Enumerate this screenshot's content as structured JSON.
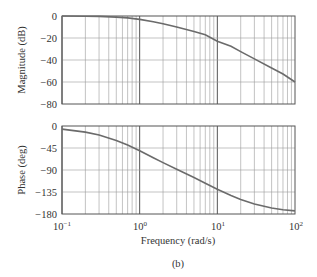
{
  "chart_data": [
    {
      "type": "line",
      "title": "",
      "xlabel": "",
      "ylabel": "Magnitude (dB)",
      "xscale": "log",
      "xlim": [
        0.1,
        100
      ],
      "ylim": [
        -80,
        0
      ],
      "yticks": [
        "0",
        "−20",
        "−40",
        "−60",
        "−80"
      ],
      "ytick_values": [
        0,
        -20,
        -40,
        -60,
        -80
      ],
      "grid": true,
      "series": [
        {
          "name": "magnitude",
          "x": [
            0.1,
            0.2,
            0.3,
            0.5,
            0.7,
            1,
            1.5,
            2,
            3,
            5,
            7,
            10,
            15,
            20,
            30,
            50,
            70,
            100
          ],
          "values": [
            -0.04,
            -0.17,
            -0.39,
            -1.0,
            -1.7,
            -3.1,
            -5.2,
            -7.0,
            -10.0,
            -14.2,
            -17.1,
            -23.0,
            -27.5,
            -32.4,
            -39.0,
            -47.3,
            -52.7,
            -60.0
          ]
        }
      ]
    },
    {
      "type": "line",
      "title": "",
      "xlabel": "Frequency (rad/s)",
      "ylabel": "Phase (deg)",
      "xscale": "log",
      "xlim": [
        0.1,
        100
      ],
      "ylim": [
        -180,
        0
      ],
      "xticks": [
        "10−1",
        "100",
        "101",
        "102"
      ],
      "xtick_values": [
        0.1,
        1,
        10,
        100
      ],
      "yticks": [
        "0",
        "−45",
        "−90",
        "−135",
        "−180"
      ],
      "ytick_values": [
        0,
        -45,
        -90,
        -135,
        -180
      ],
      "grid": true,
      "series": [
        {
          "name": "phase",
          "x": [
            0.1,
            0.2,
            0.3,
            0.5,
            0.7,
            1,
            1.5,
            2,
            3,
            5,
            7,
            10,
            15,
            20,
            30,
            50,
            70,
            100
          ],
          "values": [
            -6.3,
            -12.4,
            -18.4,
            -29.4,
            -39.0,
            -50.7,
            -65.0,
            -74.8,
            -88.3,
            -105.3,
            -116.9,
            -129.3,
            -142.0,
            -150.3,
            -159.6,
            -167.7,
            -171.2,
            -173.7
          ]
        }
      ]
    }
  ],
  "magnitude_plot": {
    "ylabel": "Magnitude (dB)",
    "yticks": [
      "0",
      "−20",
      "−40",
      "−60",
      "−80"
    ]
  },
  "phase_plot": {
    "ylabel": "Phase (deg)",
    "yticks": [
      "0",
      "−45",
      "−90",
      "−135",
      "−180"
    ]
  },
  "x_axis": {
    "label": "Frequency (rad/s)",
    "ticks": [
      {
        "base": "10",
        "exp": "−1"
      },
      {
        "base": "10",
        "exp": "0"
      },
      {
        "base": "10",
        "exp": "1"
      },
      {
        "base": "10",
        "exp": "2"
      }
    ]
  },
  "caption": "(b)",
  "colors": {
    "curve": "#6b6b6b",
    "grid": "#9a9a9a",
    "frame": "#555555"
  }
}
